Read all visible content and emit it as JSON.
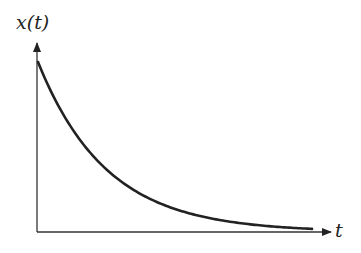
{
  "chart_data": {
    "type": "line",
    "title": "",
    "xlabel": "t",
    "ylabel": "x(t)",
    "function": "exponential decay x(t) = x0 * exp(-t)",
    "grid": false,
    "legend": null,
    "ticks": {
      "x": [],
      "y": []
    },
    "xlim": [
      0,
      4.3
    ],
    "ylim": [
      0,
      1.2
    ],
    "series": [
      {
        "name": "x(t)",
        "color": "#222222",
        "x": [
          0,
          0.25,
          0.5,
          0.75,
          1.0,
          1.25,
          1.5,
          1.75,
          2.0,
          2.25,
          2.5,
          2.75,
          3.0,
          3.25,
          3.5,
          3.75,
          4.0
        ],
        "values": [
          1.0,
          0.779,
          0.607,
          0.472,
          0.368,
          0.287,
          0.223,
          0.174,
          0.135,
          0.105,
          0.082,
          0.064,
          0.05,
          0.039,
          0.03,
          0.024,
          0.018
        ]
      }
    ]
  },
  "labels": {
    "y_axis": "x(t)",
    "x_axis": "t"
  },
  "colors": {
    "curve": "#222222",
    "axis": "#333333",
    "background": "#ffffff"
  }
}
